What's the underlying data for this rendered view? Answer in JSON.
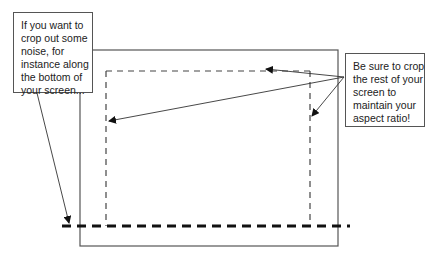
{
  "diagram": {
    "left_note": {
      "lines": [
        "If you want to",
        "crop out some",
        "noise, for",
        "instance along",
        "the bottom of",
        "your screen..."
      ]
    },
    "right_note": {
      "lines": [
        "Be sure to crop",
        "the rest of your",
        "screen to",
        "maintain your",
        "aspect ratio!"
      ]
    },
    "elements": {
      "outer_rect": "screen-frame",
      "inner_rect": "crop-region-dashed",
      "bottom_line": "crop-line-bold-dashed"
    },
    "colors": {
      "line": "#555555",
      "bold_dash": "#111111",
      "text": "#222222"
    }
  }
}
